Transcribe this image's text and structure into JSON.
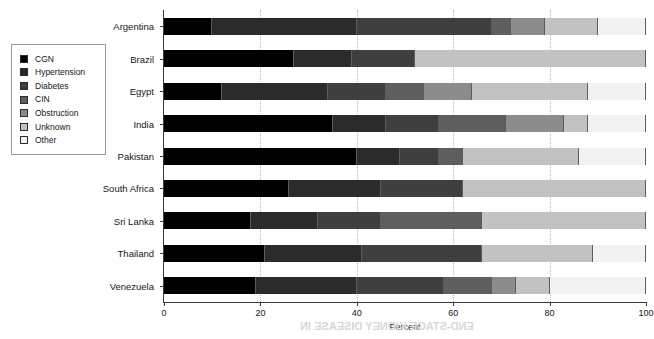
{
  "chart_data": {
    "type": "bar",
    "orientation": "horizontal",
    "stacked": true,
    "title": "",
    "xlabel": "Percent",
    "ylabel": "",
    "xlim": [
      0,
      100
    ],
    "xticks": [
      0,
      20,
      40,
      60,
      80,
      100
    ],
    "grid": "vertical-dotted",
    "legend_position": "left-outside",
    "categories": [
      "Argentina",
      "Brazil",
      "Egypt",
      "India",
      "Pakistan",
      "South Africa",
      "Sri Lanka",
      "Thailand",
      "Venezuela"
    ],
    "series": [
      {
        "name": "CGN",
        "color": "#000000",
        "values": [
          10,
          27,
          12,
          35,
          40,
          26,
          18,
          21,
          19
        ]
      },
      {
        "name": "Hypertension",
        "color": "#2b2b2b",
        "values": [
          30,
          12,
          22,
          11,
          9,
          19,
          14,
          20,
          21
        ]
      },
      {
        "name": "Diabetes",
        "color": "#3f3f3f",
        "values": [
          28,
          13,
          12,
          11,
          8,
          17,
          13,
          25,
          18
        ]
      },
      {
        "name": "CIN",
        "color": "#5e5e5e",
        "values": [
          4,
          0,
          8,
          14,
          5,
          0,
          21,
          0,
          10
        ]
      },
      {
        "name": "Obstruction",
        "color": "#8c8c8c",
        "values": [
          7,
          0,
          10,
          12,
          0,
          0,
          0,
          0,
          5
        ]
      },
      {
        "name": "Unknown",
        "color": "#c2c2c2",
        "values": [
          11,
          48,
          24,
          5,
          24,
          38,
          34,
          23,
          7
        ]
      },
      {
        "name": "Other",
        "color": "#f2f2f2",
        "values": [
          10,
          0,
          12,
          12,
          14,
          0,
          0,
          11,
          20
        ]
      }
    ]
  },
  "legend": {
    "items": [
      {
        "label": "CGN",
        "color": "#000000"
      },
      {
        "label": "Hypertension",
        "color": "#2b2b2b"
      },
      {
        "label": "Diabetes",
        "color": "#3f3f3f"
      },
      {
        "label": "CIN",
        "color": "#5e5e5e"
      },
      {
        "label": "Obstruction",
        "color": "#8c8c8c"
      },
      {
        "label": "Unknown",
        "color": "#c2c2c2"
      },
      {
        "label": "Other",
        "color": "#f2f2f2"
      }
    ]
  },
  "axis": {
    "x_label": "Percent",
    "x_tick_labels": [
      "0",
      "20",
      "40",
      "60",
      "80",
      "100"
    ]
  },
  "bleed_text": "END-STAGE KIDNEY DISEASE IN"
}
